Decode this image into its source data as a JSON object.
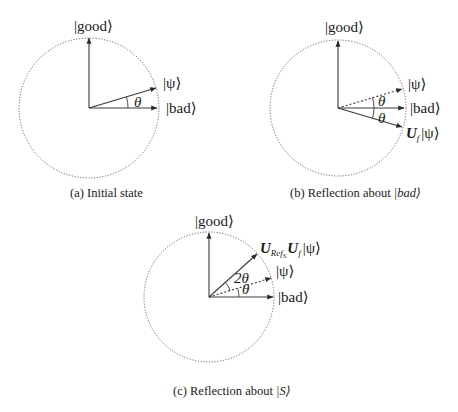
{
  "figure": {
    "panels": [
      {
        "id": "a",
        "caption": "(a) Initial state",
        "labels": {
          "good": "|good⟩",
          "psi": "|ψ⟩",
          "bad": "|bad⟩",
          "theta": "θ"
        }
      },
      {
        "id": "b",
        "caption_prefix": "(b) Reflection about ",
        "caption_ket": "|bad⟩",
        "labels": {
          "good": "|good⟩",
          "psi": "|ψ⟩",
          "bad": "|bad⟩",
          "uf_psi_U": "U",
          "uf_psi_sub": "f",
          "uf_psi_ket": "|ψ⟩",
          "theta_upper": "θ",
          "theta_lower": "θ"
        }
      },
      {
        "id": "c",
        "caption_prefix": "(c) Reflection about ",
        "caption_ket": "|S⟩",
        "labels": {
          "good": "|good⟩",
          "psi": "|ψ⟩",
          "bad": "|bad⟩",
          "result_U1": "U",
          "result_sub1": "Ref",
          "result_subsub1": "S",
          "result_U2": "U",
          "result_sub2": "f",
          "result_ket": "|ψ⟩",
          "two_theta": "2θ",
          "theta": "θ"
        }
      }
    ]
  }
}
